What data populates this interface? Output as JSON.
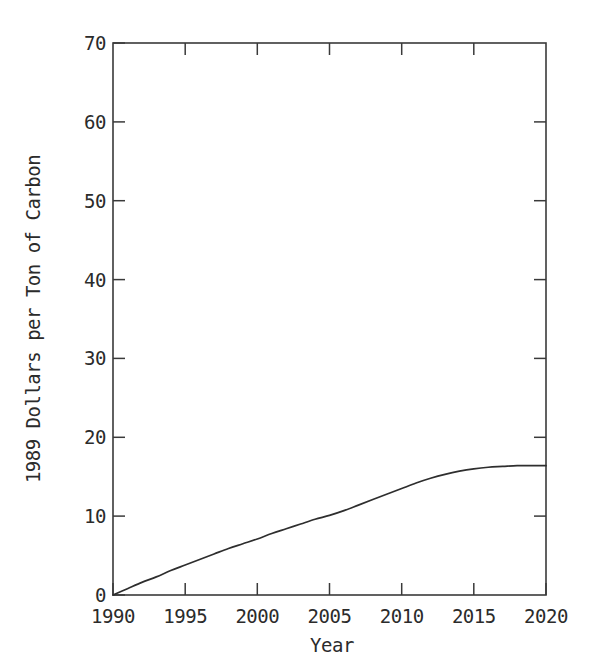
{
  "chart_data": {
    "type": "line",
    "title": "",
    "subtitle": "",
    "xlabel": "Year",
    "ylabel": "1989 Dollars per Ton of Carbon",
    "xlim": [
      1990,
      2020
    ],
    "ylim": [
      0,
      70
    ],
    "grid": false,
    "legend": null,
    "legend_position": "none",
    "x_ticks": [
      1990,
      1995,
      2000,
      2005,
      2010,
      2015,
      2020
    ],
    "x_tick_labels": [
      "1990",
      "1995",
      "2000",
      "2005",
      "2010",
      "2015",
      "2020"
    ],
    "y_ticks": [
      0,
      10,
      20,
      30,
      40,
      50,
      60,
      70
    ],
    "y_tick_labels": [
      "0",
      "10",
      "20",
      "30",
      "40",
      "50",
      "60",
      "70"
    ],
    "series": [
      {
        "name": "Carbon price",
        "x": [
          1990,
          1991,
          1992,
          1993,
          1994,
          1995,
          1996,
          1997,
          1998,
          1999,
          2000,
          2001,
          2002,
          2003,
          2004,
          2005,
          2006,
          2007,
          2008,
          2009,
          2010,
          2011,
          2012,
          2013,
          2014,
          2015,
          2016,
          2017,
          2018,
          2019,
          2020
        ],
        "values": [
          0.0,
          0.8,
          1.6,
          2.3,
          3.1,
          3.8,
          4.5,
          5.2,
          5.9,
          6.5,
          7.1,
          7.8,
          8.4,
          9.0,
          9.6,
          10.1,
          10.7,
          11.4,
          12.1,
          12.8,
          13.5,
          14.2,
          14.8,
          15.3,
          15.7,
          16.0,
          16.2,
          16.3,
          16.4,
          16.4,
          16.4
        ]
      }
    ],
    "annotations": []
  },
  "figure": {
    "background_color": "#ffffff",
    "line_color": "#2e2e2e",
    "axis_color": "#3a3a3a"
  }
}
